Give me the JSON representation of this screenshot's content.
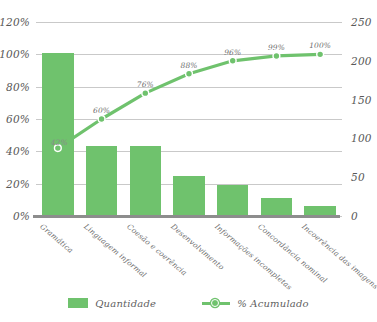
{
  "chart_data": {
    "type": "bar",
    "title": "",
    "subtitle": "",
    "xlabel": "",
    "ylabel": "",
    "grid": true,
    "legend_position": "bottom",
    "categories": [
      "Gramática",
      "Linguagem informal",
      "Coesão e coerência",
      "Desenvolvimento",
      "Informações incompletas",
      "Concordância nominal",
      "Incoerência das imagens"
    ],
    "series": [
      {
        "name": "Quantidade",
        "type": "bar",
        "axis": "right",
        "values": [
          210,
          90,
          90,
          52,
          40,
          23,
          13
        ],
        "color": "#6fc26d"
      },
      {
        "name": "% Acumulado",
        "type": "line",
        "axis": "left",
        "values": [
          42,
          60,
          76,
          88,
          96,
          99,
          100
        ],
        "labels": [
          "42%",
          "60%",
          "76%",
          "88%",
          "96%",
          "99%",
          "100%"
        ],
        "color": "#6fc26d"
      }
    ],
    "left_axis": {
      "ticks": [
        "0%",
        "20%",
        "40%",
        "60%",
        "80%",
        "100%",
        "120%"
      ],
      "values": [
        0,
        20,
        40,
        60,
        80,
        100,
        120
      ],
      "ylim": [
        0,
        120
      ]
    },
    "right_axis": {
      "ticks": [
        "0",
        "50",
        "100",
        "150",
        "200",
        "250"
      ],
      "values": [
        0,
        50,
        100,
        150,
        200,
        250
      ],
      "ylim": [
        0,
        250
      ]
    }
  },
  "legend": {
    "bar_label": "Quantidade",
    "line_label": "% Acumulado"
  },
  "colors": {
    "accent_green": "#6fc26d",
    "gridline": "#c9c9c9",
    "baseline": "#8d8d8d",
    "axis_text": "#585858"
  }
}
